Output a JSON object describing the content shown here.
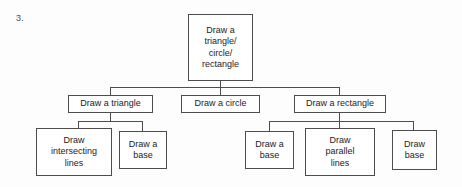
{
  "page": {
    "question_number": "3.",
    "background_color": "#fdfdfd",
    "line_color": "#4d4d4d",
    "text_color": "#1c1c1c"
  },
  "diagram": {
    "type": "tree-flowchart",
    "root": {
      "label": "Draw a\ntriangle/\ncircle/\nrectangle"
    },
    "level2": [
      {
        "label": "Draw a triangle"
      },
      {
        "label": "Draw a circle"
      },
      {
        "label": "Draw a rectangle"
      }
    ],
    "level3_triangle": [
      {
        "label": "Draw\nintersecting\nlines"
      },
      {
        "label": "Draw a\nbase"
      }
    ],
    "level3_rectangle": [
      {
        "label": "Draw a\nbase"
      },
      {
        "label": "Draw\nparallel\nlines"
      },
      {
        "label": "Draw\nbase"
      }
    ]
  }
}
